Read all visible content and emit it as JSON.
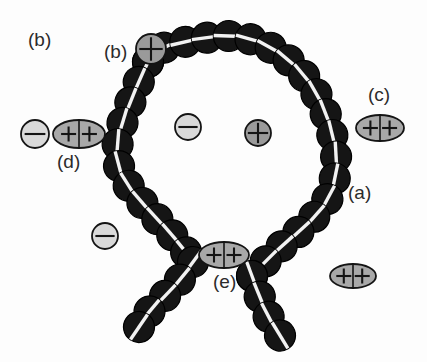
{
  "figure": {
    "width": 427,
    "height": 362,
    "background_color": "#fdfdfd"
  },
  "colors": {
    "monomer_fill": "#151515",
    "monomer_stroke": "#000000",
    "monomer_stripe": "#f2f2f2",
    "anion_fill": "#d9d9d9",
    "cation_fill": "#9a9a9a",
    "divalent_fill": "#a8a8a8",
    "symbol_stroke": "#141414",
    "label_color": "#2b2b2b"
  },
  "labels": [
    {
      "id": "b-free",
      "text": "(b)",
      "x": 28,
      "y": 30
    },
    {
      "id": "b-bound",
      "text": "(b)",
      "x": 104,
      "y": 42
    },
    {
      "id": "c",
      "text": "(c)",
      "x": 368,
      "y": 85
    },
    {
      "id": "d",
      "text": "(d)",
      "x": 57,
      "y": 152
    },
    {
      "id": "a",
      "text": "(a)",
      "x": 348,
      "y": 183
    },
    {
      "id": "e",
      "text": "(e)",
      "x": 213,
      "y": 272
    }
  ],
  "legend_meaning": {
    "a": "charged monomer bead of the polyelectrolyte chain",
    "b": "monovalent counterion condensed on the chain",
    "c": "divalent counterion bridging to the chain",
    "d": "free ion pair: anion plus divalent cation near the chain",
    "e": "divalent counterion bridging two chain segments at the loop junction"
  },
  "chain": {
    "name": "polyelectrolyte-backbone",
    "bead_radius": 15.5,
    "loop_path": [
      [
        148,
        62
      ],
      [
        160,
        49
      ],
      [
        176,
        44
      ],
      [
        193,
        40
      ],
      [
        211,
        37
      ],
      [
        229,
        36
      ],
      [
        247,
        38
      ],
      [
        264,
        44
      ],
      [
        280,
        53
      ],
      [
        294,
        65
      ],
      [
        307,
        79
      ],
      [
        317,
        95
      ],
      [
        325,
        112
      ],
      [
        331,
        129
      ],
      [
        335,
        147
      ],
      [
        337,
        165
      ],
      [
        334,
        183
      ],
      [
        327,
        200
      ],
      [
        316,
        215
      ],
      [
        303,
        228
      ],
      [
        289,
        240
      ],
      [
        275,
        252
      ],
      [
        263,
        264
      ],
      [
        252,
        276
      ]
    ],
    "left_arm_path": [
      [
        148,
        62
      ],
      [
        140,
        79
      ],
      [
        133,
        96
      ],
      [
        126,
        113
      ],
      [
        120,
        130
      ],
      [
        117,
        148
      ],
      [
        119,
        166
      ],
      [
        126,
        182
      ],
      [
        136,
        196
      ],
      [
        148,
        209
      ],
      [
        160,
        222
      ],
      [
        172,
        235
      ],
      [
        183,
        248
      ],
      [
        193,
        262
      ]
    ],
    "left_tail_path": [
      [
        193,
        262
      ],
      [
        183,
        276
      ],
      [
        172,
        289
      ],
      [
        160,
        301
      ],
      [
        148,
        313
      ],
      [
        139,
        327
      ]
    ],
    "right_tail_path": [
      [
        252,
        276
      ],
      [
        258,
        292
      ],
      [
        264,
        308
      ],
      [
        272,
        323
      ],
      [
        281,
        337
      ]
    ]
  },
  "condensed_ions": [
    {
      "id": "b-bound-cation",
      "kind": "cation-circle",
      "charge": "+",
      "x": 151,
      "y": 49,
      "rx": 15,
      "ry": 15
    }
  ],
  "free_ions": [
    {
      "id": "inner-anion",
      "kind": "anion-circle",
      "charge": "−",
      "x": 188,
      "y": 127,
      "rx": 13,
      "ry": 13
    },
    {
      "id": "inner-cation",
      "kind": "cation-circle",
      "charge": "+",
      "x": 258,
      "y": 133,
      "rx": 13,
      "ry": 13
    },
    {
      "id": "outer-anion",
      "kind": "anion-circle",
      "charge": "−",
      "x": 105,
      "y": 236,
      "rx": 13,
      "ry": 13
    },
    {
      "id": "free-divalent",
      "kind": "divalent-ellipse",
      "charge": "++",
      "x": 353,
      "y": 276,
      "rx": 23,
      "ry": 12
    }
  ],
  "pair_d": {
    "id": "d-ion-pair",
    "anion": {
      "charge": "−",
      "x": 35,
      "y": 134,
      "rx": 14,
      "ry": 14
    },
    "divalent": {
      "charge": "++",
      "x": 79,
      "y": 134,
      "rx": 26,
      "ry": 14
    }
  },
  "bridging_ions": [
    {
      "id": "c-divalent",
      "kind": "divalent-ellipse",
      "charge": "++",
      "x": 380,
      "y": 128,
      "rx": 24,
      "ry": 13
    },
    {
      "id": "e-divalent",
      "kind": "divalent-ellipse",
      "charge": "++",
      "x": 224,
      "y": 255,
      "rx": 25,
      "ry": 13
    }
  ]
}
